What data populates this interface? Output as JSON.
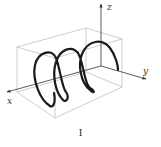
{
  "figure": {
    "caption": "I",
    "axes": {
      "x_label": "x",
      "y_label": "y",
      "z_label": "z"
    },
    "colors": {
      "helix": "#1a1a1a",
      "box": "#b8b8b8",
      "axis": "#333333"
    }
  }
}
